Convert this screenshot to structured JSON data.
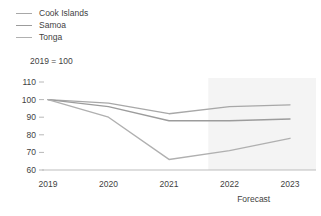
{
  "legend": {
    "items": [
      {
        "label": "Cook Islands",
        "color": "#a8a8a8",
        "icon": "legend-line-icon"
      },
      {
        "label": "Samoa",
        "color": "#9c9c9c",
        "icon": "legend-line-icon"
      },
      {
        "label": "Tonga",
        "color": "#b0b0b0",
        "icon": "legend-line-icon"
      }
    ]
  },
  "subtitle": "2019 = 100",
  "forecast": {
    "label": "Forecast",
    "start_x": 2021.65,
    "band_color": "#f4f4f4"
  },
  "axis": {
    "y_ticks": [
      "110",
      "100",
      "90",
      "80",
      "70",
      "60"
    ],
    "x_ticks": [
      "2019",
      "2020",
      "2021",
      "2022",
      "2023"
    ]
  },
  "chart_data": {
    "type": "line",
    "title": "",
    "subtitle": "2019 = 100",
    "xlabel": "",
    "ylabel": "",
    "x": [
      2019,
      2020,
      2021,
      2022,
      2023
    ],
    "categories": [
      "2019",
      "2020",
      "2021",
      "2022",
      "2023"
    ],
    "series": [
      {
        "name": "Cook Islands",
        "values": [
          100,
          98,
          92,
          96,
          97
        ],
        "color": "#a8a8a8"
      },
      {
        "name": "Samoa",
        "values": [
          100,
          96,
          88,
          88,
          89
        ],
        "color": "#9c9c9c"
      },
      {
        "name": "Tonga",
        "values": [
          100,
          90,
          66,
          71,
          78
        ],
        "color": "#b0b0b0"
      }
    ],
    "ylim": [
      60,
      110
    ],
    "xlim": [
      2019,
      2023
    ],
    "yticks": [
      60,
      70,
      80,
      90,
      100,
      110
    ],
    "xticks": [
      2019,
      2020,
      2021,
      2022,
      2023
    ],
    "grid": false,
    "legend_position": "top-left",
    "annotations": [
      {
        "text": "Forecast",
        "x": 2022.4,
        "type": "shaded-region-label"
      }
    ]
  }
}
